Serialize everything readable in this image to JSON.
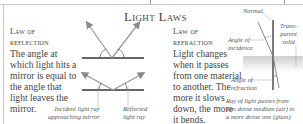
{
  "title": "Light Laws",
  "reflection": {
    "heading_line1": "Law of",
    "heading_line2": "reflection",
    "body_lines": [
      "The angle at",
      "which light hits a",
      "mirror is equal to",
      "the angle that",
      "light leaves the",
      "mirror."
    ],
    "caption_incident_1": "Incident light ray",
    "caption_incident_2": "approaching mirror",
    "caption_reflected_1": "Reflected",
    "caption_reflected_2": "light ray"
  },
  "refraction": {
    "heading_line1": "Law of",
    "heading_line2": "refraction",
    "body_lines": [
      "Light changes",
      "when it passes",
      "from one material",
      "to another. The",
      "more it slows",
      "down, the more",
      "it bends."
    ],
    "label_normal": "Normal",
    "label_transparent_1": "Trans-",
    "label_transparent_2": "parent",
    "label_transparent_3": "solid",
    "label_incidence_1": "Angle of",
    "label_incidence_2": "incidence",
    "label_refraction_1": "Angle of",
    "label_refraction_2": "refraction",
    "caption_lines": [
      "Ray of light passes from",
      "less dense medium (air) to",
      "a more dense one (glass)"
    ]
  },
  "colors": {
    "ray": "#9a9a9a",
    "mirror": "#333333",
    "glass": "#d8d8d8",
    "text": "#444444"
  }
}
